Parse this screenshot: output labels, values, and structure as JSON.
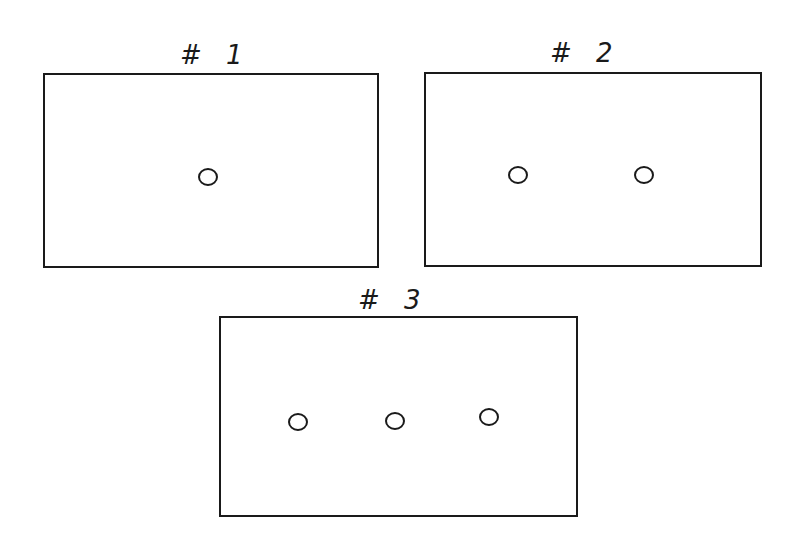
{
  "diagram": {
    "panels": [
      {
        "label": "# 1",
        "circle_count": 1,
        "box": {
          "x": 43,
          "y": 73,
          "w": 336,
          "h": 195
        },
        "label_pos": {
          "x": 180,
          "y": 42
        },
        "circles": [
          {
            "cx": 208,
            "cy": 177
          }
        ]
      },
      {
        "label": "# 2",
        "circle_count": 2,
        "box": {
          "x": 424,
          "y": 72,
          "w": 338,
          "h": 195
        },
        "label_pos": {
          "x": 550,
          "y": 40
        },
        "circles": [
          {
            "cx": 518,
            "cy": 175
          },
          {
            "cx": 644,
            "cy": 175
          }
        ]
      },
      {
        "label": "# 3",
        "circle_count": 3,
        "box": {
          "x": 219,
          "y": 316,
          "w": 359,
          "h": 201
        },
        "label_pos": {
          "x": 358,
          "y": 287
        },
        "circles": [
          {
            "cx": 298,
            "cy": 422
          },
          {
            "cx": 395,
            "cy": 421
          },
          {
            "cx": 489,
            "cy": 417
          }
        ]
      }
    ],
    "stroke_color": "#1a1a1a",
    "background_color": "#ffffff"
  }
}
